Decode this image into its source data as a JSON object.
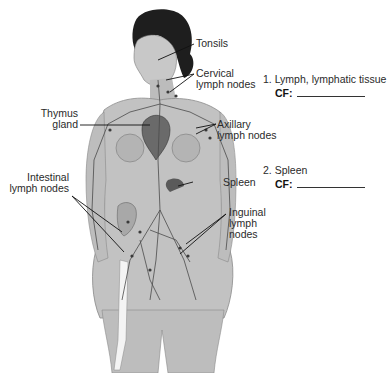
{
  "diagram": {
    "labels": {
      "tonsils": "Tonsils",
      "cervical_1": "Cervical",
      "cervical_2": "lymph nodes",
      "thymus_1": "Thymus",
      "thymus_2": "gland",
      "axillary_1": "Axillary",
      "axillary_2": "lymph nodes",
      "intestinal_1": "Intestinal",
      "intestinal_2": "lymph nodes",
      "spleen": "Spleen",
      "inguinal_1": "Inguinal",
      "inguinal_2": "lymph",
      "inguinal_3": "nodes"
    }
  },
  "questions": [
    {
      "number": "1.",
      "text": "1. Lymph, lymphatic tissue",
      "cf_label": "CF:"
    },
    {
      "number": "2.",
      "text": "2. Spleen",
      "cf_label": "CF:"
    }
  ],
  "colors": {
    "skin": "#bdbdbd",
    "skin_dark": "#8a8a8a",
    "hair": "#1e1e1e",
    "vessel": "#4a4a4a",
    "leader_line": "#111111"
  }
}
